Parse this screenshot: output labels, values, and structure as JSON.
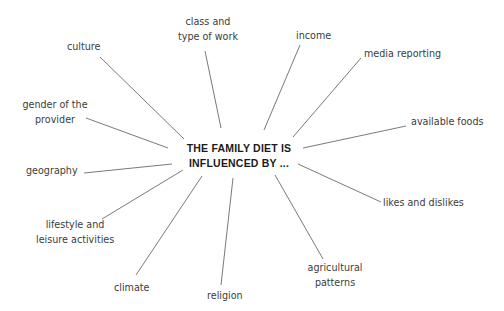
{
  "diagram": {
    "type": "spider-diagram",
    "center": {
      "lines": [
        "THE FAMILY DIET IS",
        "INFLUENCED BY ..."
      ]
    },
    "factors": [
      {
        "id": "culture",
        "lines": [
          "culture"
        ]
      },
      {
        "id": "class-and-type-of-work",
        "lines": [
          "class and",
          "type of work"
        ]
      },
      {
        "id": "income",
        "lines": [
          "income"
        ]
      },
      {
        "id": "media-reporting",
        "lines": [
          "media reporting"
        ]
      },
      {
        "id": "available-foods",
        "lines": [
          "available foods"
        ]
      },
      {
        "id": "likes-and-dislikes",
        "lines": [
          "likes and dislikes"
        ]
      },
      {
        "id": "agricultural-patterns",
        "lines": [
          "agricultural",
          "patterns"
        ]
      },
      {
        "id": "religion",
        "lines": [
          "religion"
        ]
      },
      {
        "id": "climate",
        "lines": [
          "climate"
        ]
      },
      {
        "id": "lifestyle-and-leisure-activities",
        "lines": [
          "lifestyle and",
          "leisure activities"
        ]
      },
      {
        "id": "geography",
        "lines": [
          "geography"
        ]
      },
      {
        "id": "gender-of-the-provider",
        "lines": [
          "gender of the",
          "provider"
        ]
      }
    ],
    "connector_color": "#6a6a6a",
    "title_color": "#1a1a1a",
    "label_color": "#3c3c3c"
  }
}
